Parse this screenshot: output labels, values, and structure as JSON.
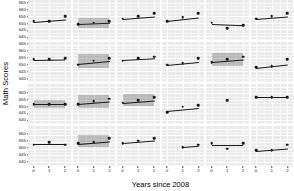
{
  "chart_data": {
    "type": "scatter",
    "title": "",
    "xlabel": "Years since 2008",
    "ylabel": "Math Scores",
    "xlim": [
      -0.35,
      2.35
    ],
    "ylim": [
      637,
      667
    ],
    "xticks": [
      0,
      1,
      2
    ],
    "xtick_labels": [
      "0",
      "1",
      "2"
    ],
    "ytick_step": 5,
    "grid": true,
    "legend": "none",
    "facet_rows": 4,
    "facet_cols": 6,
    "panel_bg": "#ebebeb",
    "grid_color": "#ffffff",
    "point_color": "#1a1a1a",
    "line_color": "#1a1a1a",
    "band_color": "rgba(70,70,70,0.30)",
    "row_ytick_labels": [
      [
        "665",
        "660",
        "655",
        "650",
        "645",
        "640"
      ],
      [
        "665",
        "660",
        "655",
        "650",
        "645",
        "640"
      ],
      [
        "660",
        "655",
        "650",
        "645",
        "640"
      ],
      [
        "660",
        "655",
        "650",
        "645",
        "640"
      ]
    ],
    "panels": [
      {
        "row": 0,
        "col": 0,
        "x": [
          0,
          1,
          2
        ],
        "y": [
          651,
          651,
          655
        ],
        "band": false
      },
      {
        "row": 0,
        "col": 1,
        "x": [
          0,
          1,
          2
        ],
        "y": [
          649,
          650,
          651
        ],
        "band": true
      },
      {
        "row": 0,
        "col": 2,
        "x": [
          0,
          1,
          2
        ],
        "y": [
          653,
          655,
          657
        ],
        "band": false
      },
      {
        "row": 0,
        "col": 3,
        "x": [
          0,
          1,
          2
        ],
        "y": [
          651,
          654,
          657
        ],
        "band": false
      },
      {
        "row": 0,
        "col": 4,
        "x": [
          0,
          1,
          2
        ],
        "y": [
          650,
          646,
          648
        ],
        "band": false
      },
      {
        "row": 0,
        "col": 5,
        "x": [
          0,
          1,
          2
        ],
        "y": [
          653,
          655,
          657
        ],
        "band": false
      },
      {
        "row": 1,
        "col": 0,
        "x": [
          0,
          1,
          2
        ],
        "y": [
          654,
          654,
          655
        ],
        "band": false
      },
      {
        "row": 1,
        "col": 1,
        "x": [
          0,
          1,
          2
        ],
        "y": [
          650,
          653,
          655
        ],
        "band": true
      },
      {
        "row": 1,
        "col": 2,
        "x": [
          0,
          1,
          2
        ],
        "y": [
          653,
          655,
          656
        ],
        "band": false
      },
      {
        "row": 1,
        "col": 3,
        "x": [
          0,
          1,
          2
        ],
        "y": [
          650,
          651,
          655
        ],
        "band": false
      },
      {
        "row": 1,
        "col": 4,
        "x": [
          0,
          1,
          2
        ],
        "y": [
          652,
          654,
          656
        ],
        "band": true
      },
      {
        "row": 1,
        "col": 5,
        "x": [
          0,
          1,
          2
        ],
        "y": [
          648,
          649,
          654
        ],
        "band": false
      },
      {
        "row": 2,
        "col": 0,
        "x": [
          0,
          1,
          2
        ],
        "y": [
          652,
          652,
          652
        ],
        "band": true
      },
      {
        "row": 2,
        "col": 1,
        "x": [
          0,
          1,
          2
        ],
        "y": [
          652,
          654,
          656
        ],
        "band": true
      },
      {
        "row": 2,
        "col": 2,
        "x": [
          0,
          1,
          2
        ],
        "y": [
          653,
          655,
          657
        ],
        "band": true
      },
      {
        "row": 2,
        "col": 3,
        "x": [
          0,
          1,
          2
        ],
        "y": [
          646,
          650,
          651
        ],
        "band": false
      },
      {
        "row": 2,
        "col": 4,
        "x": [
          1
        ],
        "y": [
          655
        ],
        "band": false
      },
      {
        "row": 2,
        "col": 5,
        "x": [
          0,
          1,
          2
        ],
        "y": [
          657,
          657,
          657
        ],
        "band": false
      },
      {
        "row": 3,
        "col": 0,
        "x": [
          0,
          1,
          2
        ],
        "y": [
          653,
          655,
          653
        ],
        "band": false
      },
      {
        "row": 3,
        "col": 1,
        "x": [
          0,
          1,
          2
        ],
        "y": [
          654,
          655,
          658
        ],
        "band": true
      },
      {
        "row": 3,
        "col": 2,
        "x": [
          0,
          1,
          2
        ],
        "y": [
          654,
          656,
          658
        ],
        "band": false
      },
      {
        "row": 3,
        "col": 3,
        "x": [
          1,
          2
        ],
        "y": [
          651,
          653
        ],
        "band": false
      },
      {
        "row": 3,
        "col": 4,
        "x": [
          0,
          1,
          2
        ],
        "y": [
          654,
          650,
          654
        ],
        "band": false
      },
      {
        "row": 3,
        "col": 5,
        "x": [
          0,
          1,
          2
        ],
        "y": [
          649,
          649,
          653
        ],
        "band": false
      }
    ]
  }
}
